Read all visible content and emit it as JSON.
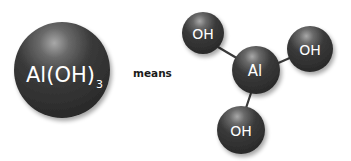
{
  "formula": {
    "main": "Al(OH)",
    "subscript": "3"
  },
  "connector_text": "means",
  "molecule": {
    "center_atom": "Al",
    "ligands": [
      "OH",
      "OH",
      "OH"
    ]
  },
  "colors": {
    "sphere_dark": "#2b2b2b",
    "sphere_highlight": "#9a9a9a",
    "bond": "#3a3a3a",
    "label": "#ffffff",
    "text": "#1a1a1a"
  }
}
